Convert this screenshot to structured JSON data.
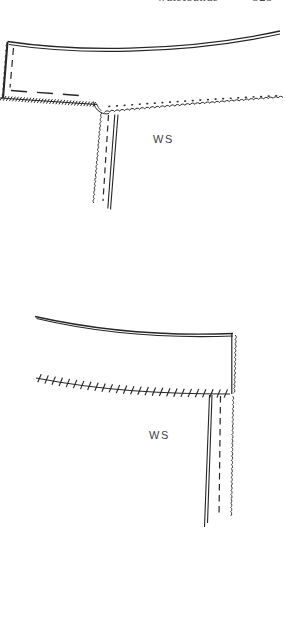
{
  "page": {
    "header": {
      "running_title": "waistbands",
      "page_number": "323"
    },
    "colors": {
      "paper": "#ffffff",
      "ink": "#262626",
      "label_text": "#3f3f3f"
    }
  },
  "figures": {
    "top": {
      "label": "WS"
    },
    "bottom": {
      "label": "WS"
    }
  }
}
